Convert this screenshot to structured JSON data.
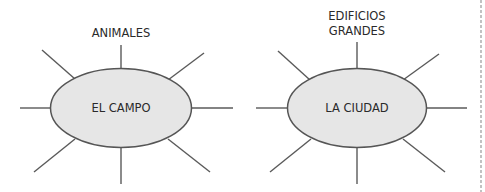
{
  "diagrams": [
    {
      "center_label": "EL CAMPO",
      "spoke_labels": {
        "top": "ANIMALES"
      }
    },
    {
      "center_label": "LA CIUDAD",
      "spoke_labels": {
        "top_line1": "EDIFICIOS",
        "top_line2": "GRANDES"
      }
    }
  ],
  "colors": {
    "bubble_fill": "#e6e6e6",
    "line": "#5a5a5a",
    "divider": "#9a9a9a"
  }
}
